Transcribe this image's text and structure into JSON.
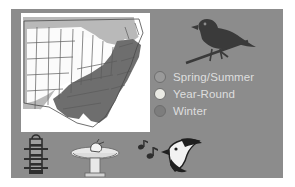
{
  "panel": {
    "background_color": "#8c8c8c",
    "frame_color": "#ffffff"
  },
  "map": {
    "name": "us-range-map",
    "title": "Range Map",
    "ocean_color": "#ffffff",
    "summer_color": "#b3b3b3",
    "yearround_color": "#f0f0f0",
    "winter_color": "#6e6e6e",
    "border_color": "#555555",
    "regions": [
      {
        "label": "Spring/Summer",
        "color": "#b3b3b3"
      },
      {
        "label": "Year-Round",
        "color": "#f0f0f0"
      },
      {
        "label": "Winter",
        "color": "#6e6e6e"
      }
    ]
  },
  "bird": {
    "name": "perched-bird-silhouette",
    "color": "#3a3a3a",
    "branch_color": "#3a3a3a"
  },
  "legend": {
    "items": [
      {
        "label": "Spring/Summer",
        "swatch_color": "#9a9a9a",
        "swatch_name": "legend-swatch-spring-summer"
      },
      {
        "label": "Year-Round",
        "swatch_color": "#eaeae4",
        "swatch_name": "legend-swatch-year-round"
      },
      {
        "label": "Winter",
        "swatch_color": "#7d7d7d",
        "swatch_name": "legend-swatch-winter"
      }
    ],
    "text_color": "#dedede"
  },
  "icons": [
    {
      "name": "tube-feeder-icon",
      "label": "Tube Feeder",
      "color": "#2e2e2e"
    },
    {
      "name": "bird-bath-icon",
      "label": "Bird Bath",
      "color": "#e8e8e8"
    },
    {
      "name": "music-notes-icon",
      "label": "Song",
      "color": "#2e2e2e"
    },
    {
      "name": "singing-bird-icon",
      "label": "Singing Bird",
      "color": "#1f1f1f"
    }
  ]
}
